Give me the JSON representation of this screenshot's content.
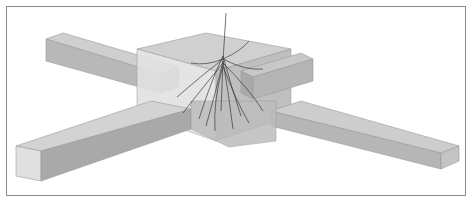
{
  "figure": {
    "colors": {
      "background": "#ffffff",
      "frame_border": "#8a8a8a",
      "box_light": "#d8d8d8",
      "box_mid": "#bdbdbd",
      "box_dark": "#9a9a9a",
      "root": "#3a3a3a"
    }
  }
}
